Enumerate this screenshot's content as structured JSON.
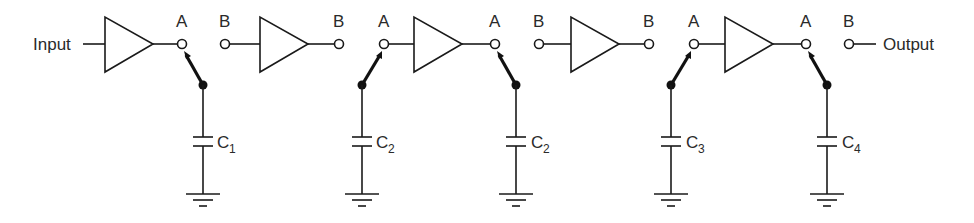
{
  "diagram": {
    "type": "circuit-schematic",
    "input_label": "Input",
    "output_label": "Output",
    "node_labels": {
      "a": "A",
      "b": "B"
    },
    "amplifiers": [
      {
        "id": "amp1",
        "input_node": "Input",
        "output_node": "A"
      },
      {
        "id": "amp2",
        "input_node": "B",
        "output_node": "B"
      },
      {
        "id": "amp3",
        "input_node": "A",
        "output_node": "A"
      },
      {
        "id": "amp4",
        "input_node": "B",
        "output_node": "B"
      },
      {
        "id": "amp5",
        "input_node": "A",
        "output_node": "A"
      }
    ],
    "capacitors": [
      {
        "label": "C",
        "subscript": "1",
        "switch_to": "A"
      },
      {
        "label": "C",
        "subscript": "2",
        "switch_to": "A"
      },
      {
        "label": "C",
        "subscript": "2",
        "switch_to": "A"
      },
      {
        "label": "C",
        "subscript": "3",
        "switch_to": "A"
      },
      {
        "label": "C",
        "subscript": "4",
        "switch_to": "A"
      }
    ],
    "colors": {
      "line": "#1a1a1a",
      "background": "#ffffff"
    }
  }
}
